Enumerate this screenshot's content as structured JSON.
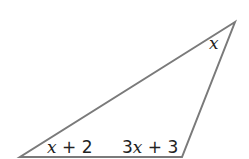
{
  "diagram": {
    "type": "triangle",
    "stroke_color": "#7a7a7a",
    "vertices": {
      "top_right": [
        235,
        22
      ],
      "bottom_left": [
        20,
        157
      ],
      "bottom_right": [
        182,
        157
      ]
    },
    "angle_labels": {
      "top": {
        "var": "x",
        "rest": ""
      },
      "bottom_left": {
        "var": "x",
        "rest": " + 2"
      },
      "bottom_right": {
        "prefix": "3",
        "var": "x",
        "rest": " + 3"
      }
    }
  }
}
